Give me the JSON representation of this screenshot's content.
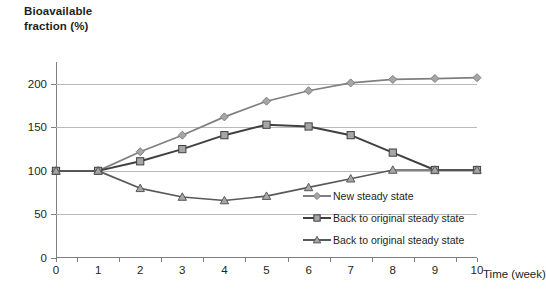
{
  "axes": {
    "y_title": "Bioavailable\nfraction (%)",
    "x_title": "Time (week)",
    "y_ticks": [
      "0",
      "50",
      "100",
      "150",
      "200"
    ],
    "x_ticks": [
      "0",
      "1",
      "2",
      "3",
      "4",
      "5",
      "6",
      "7",
      "8",
      "9",
      "10"
    ]
  },
  "legend": {
    "items": [
      {
        "label": "New steady state",
        "marker": "diamond",
        "color": "#7f7f7f"
      },
      {
        "label": "Back to original steady state",
        "marker": "square",
        "color": "#404040"
      },
      {
        "label": "Back to original steady state",
        "marker": "triangle",
        "color": "#595959"
      }
    ]
  },
  "chart_data": {
    "type": "line",
    "title": "",
    "xlabel": "Time (week)",
    "ylabel": "Bioavailable fraction (%)",
    "x": [
      0,
      1,
      2,
      3,
      4,
      5,
      6,
      7,
      8,
      9,
      10
    ],
    "xlim": [
      0,
      10
    ],
    "ylim": [
      0,
      225
    ],
    "yticks": [
      0,
      50,
      100,
      150,
      200
    ],
    "grid": "horizontal",
    "legend_position": "inside-right",
    "series": [
      {
        "name": "New steady state",
        "marker": "diamond",
        "color": "#7f7f7f",
        "values": [
          100,
          100,
          122,
          141,
          162,
          180,
          192,
          201,
          205,
          206,
          207
        ]
      },
      {
        "name": "Back to original steady state",
        "marker": "square",
        "color": "#404040",
        "values": [
          100,
          100,
          111,
          125,
          141,
          153,
          151,
          141,
          121,
          101,
          101
        ]
      },
      {
        "name": "Back to original steady state",
        "marker": "triangle",
        "color": "#595959",
        "values": [
          100,
          100,
          80,
          70,
          66,
          71,
          81,
          91,
          101,
          101,
          101
        ]
      }
    ]
  }
}
